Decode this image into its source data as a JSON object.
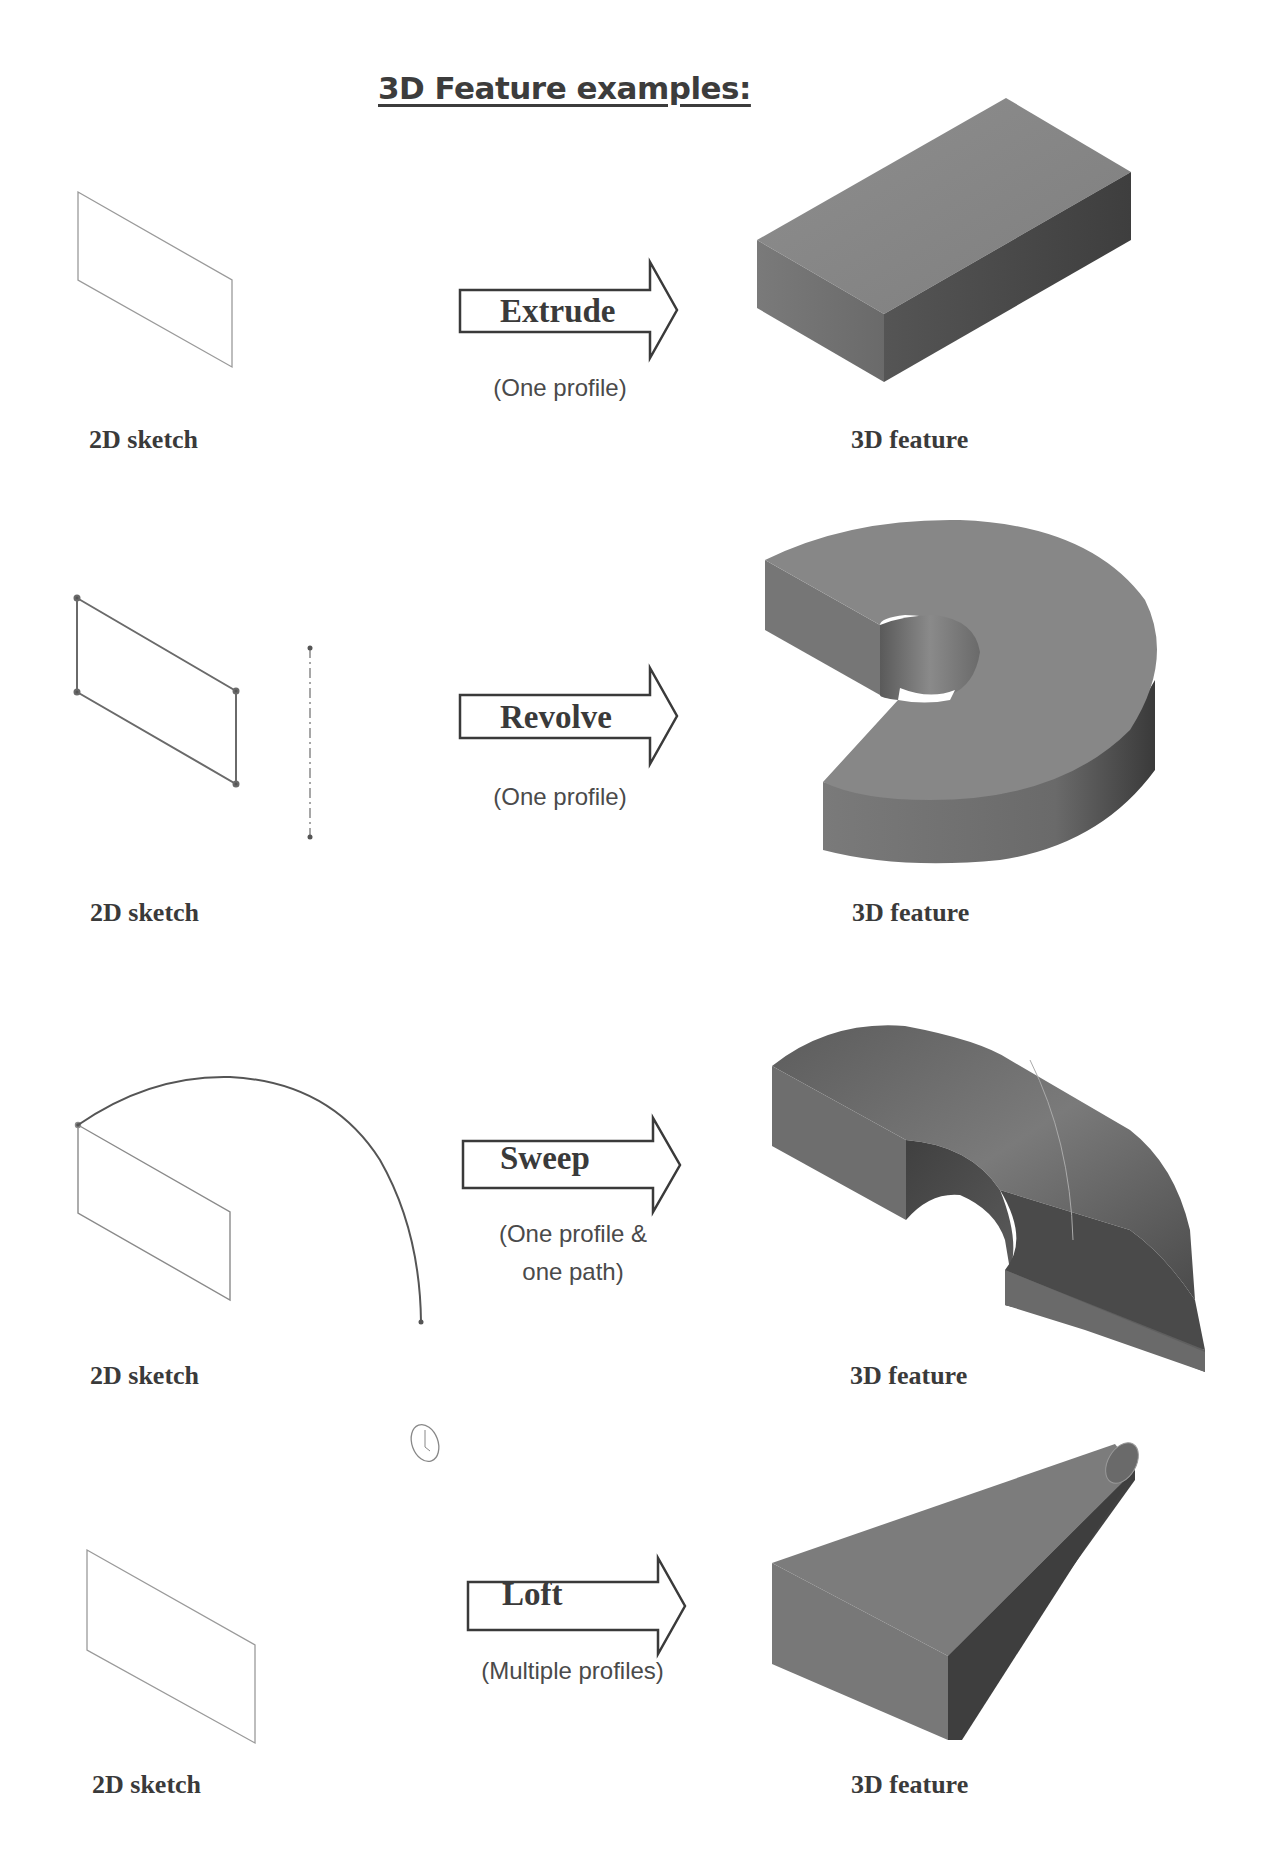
{
  "page": {
    "title": "3D Feature examples:"
  },
  "rows": [
    {
      "operation": "Extrude",
      "note_lines": [
        "(One profile)"
      ],
      "left_label": "2D sketch",
      "right_label": "3D feature",
      "shape": "rectangular block"
    },
    {
      "operation": "Revolve",
      "note_lines": [
        "(One profile)"
      ],
      "left_label": "2D sketch",
      "right_label": "3D feature",
      "shape": "partial ring (revolved rectangle around centerline)"
    },
    {
      "operation": "Sweep",
      "note_lines": [
        "(One profile &",
        "one path)"
      ],
      "left_label": "2D sketch",
      "right_label": "3D feature",
      "shape": "swept rectangle along arc path"
    },
    {
      "operation": "Loft",
      "note_lines": [
        "(Multiple profiles)"
      ],
      "left_label": "2D sketch",
      "right_label": "3D feature",
      "shape": "rectangle lofted to circle"
    }
  ],
  "colors": {
    "text": "#3a3a3a",
    "solid_light": "#8a8a8a",
    "solid_mid": "#707070",
    "solid_dark": "#404040",
    "sketch_line": "#8c8c8c"
  }
}
